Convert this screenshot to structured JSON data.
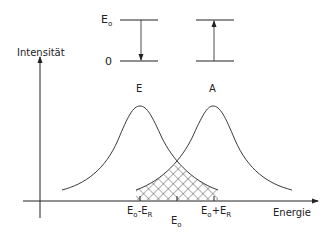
{
  "diagram": {
    "type": "emission-absorption-overlap",
    "level_scheme": {
      "upper_level_label": "E",
      "upper_level_sub": "o",
      "lower_level_label": "0",
      "transitions": [
        {
          "name": "emission",
          "direction": "down"
        },
        {
          "name": "absorption",
          "direction": "up"
        }
      ]
    },
    "y_axis_label": "Intensität",
    "x_axis_label": "Energie",
    "curves": [
      {
        "label": "E",
        "center_label": "Eo-ER"
      },
      {
        "label": "A",
        "center_label": "Eo+ER"
      }
    ],
    "ticks": {
      "left": {
        "main": "E",
        "sub1": "o",
        "op": "-E",
        "sub2": "R"
      },
      "center": {
        "main": "E",
        "sub1": "o"
      },
      "right": {
        "main": "E",
        "sub1": "o",
        "op": "+E",
        "sub2": "R"
      }
    },
    "overlap_region": "cross-hatched",
    "colors": {
      "line": "#222222",
      "background": "#ffffff"
    }
  }
}
